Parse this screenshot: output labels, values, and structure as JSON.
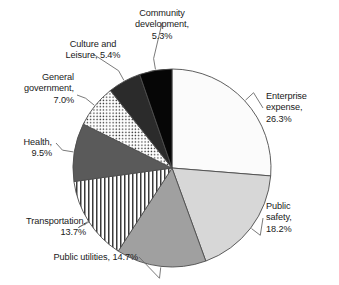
{
  "chart_data": {
    "type": "pie",
    "title": "",
    "subtitle": "",
    "xlabel": "",
    "ylabel": "",
    "legend_position": "none",
    "grid": false,
    "units": "percent",
    "start_angle_deg": 0,
    "direction": "clockwise",
    "categories": [
      "Enterprise expense",
      "Public safety",
      "Public utilities",
      "Transportation",
      "Health",
      "General government",
      "Culture and Leisure",
      "Community development"
    ],
    "values": [
      26.3,
      18.2,
      14.7,
      13.7,
      9.5,
      7.0,
      5.4,
      5.3
    ],
    "slices": [
      {
        "name": "Enterprise expense",
        "value": 26.3,
        "label_text": "Enterprise\nexpense,\n26.3%",
        "fill": "#fbfbfb",
        "pattern": "solid",
        "stroke": "#4d4d4d"
      },
      {
        "name": "Public safety",
        "value": 18.2,
        "label_text": "Public\nsafety,\n18.2%",
        "fill": "#d7d7d7",
        "pattern": "solid",
        "stroke": "#4d4d4d"
      },
      {
        "name": "Public utilities",
        "value": 14.7,
        "label_text": "Public utilities, 14.7%",
        "fill": "#a0a0a0",
        "pattern": "solid",
        "stroke": "#4d4d4d"
      },
      {
        "name": "Transportation",
        "value": 13.7,
        "label_text": "Transportation,\n13.7%",
        "fill": "#ffffff",
        "pattern": "vertical-stripes",
        "stroke": "#4d4d4d"
      },
      {
        "name": "Health",
        "value": 9.5,
        "label_text": "Health,\n9.5%",
        "fill": "#5a5a5a",
        "pattern": "solid",
        "stroke": "#4d4d4d"
      },
      {
        "name": "General government",
        "value": 7.0,
        "label_text": "General\ngovernment,\n7.0%",
        "fill": "#ffffff",
        "pattern": "dots",
        "stroke": "#4d4d4d"
      },
      {
        "name": "Culture and Leisure",
        "value": 5.4,
        "label_text": "Culture and\nLeisure, 5.4%",
        "fill": "#2b2b2b",
        "pattern": "solid",
        "stroke": "#4d4d4d"
      },
      {
        "name": "Community development",
        "value": 5.3,
        "label_text": "Community\ndevelopment,\n5.3%",
        "fill": "#060606",
        "pattern": "solid",
        "stroke": "#4d4d4d"
      }
    ]
  },
  "colors": {
    "background": "#ffffff",
    "text": "#1a1a1a",
    "leader_line": "#6b6b6b",
    "slice_outline": "#4d4d4d"
  }
}
